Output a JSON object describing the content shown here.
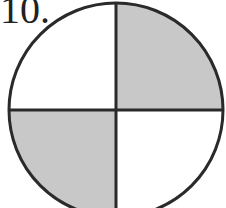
{
  "problem": {
    "number": "10."
  },
  "figure": {
    "type": "circle-quadrants",
    "center": [
      116,
      110
    ],
    "radius": 107,
    "shaded_color": "#c8c8c8",
    "stroke_color": "#2a2a2a",
    "quadrants": [
      {
        "position": "top-left",
        "shaded": false
      },
      {
        "position": "top-right",
        "shaded": true
      },
      {
        "position": "bottom-left",
        "shaded": true
      },
      {
        "position": "bottom-right",
        "shaded": false
      }
    ]
  }
}
